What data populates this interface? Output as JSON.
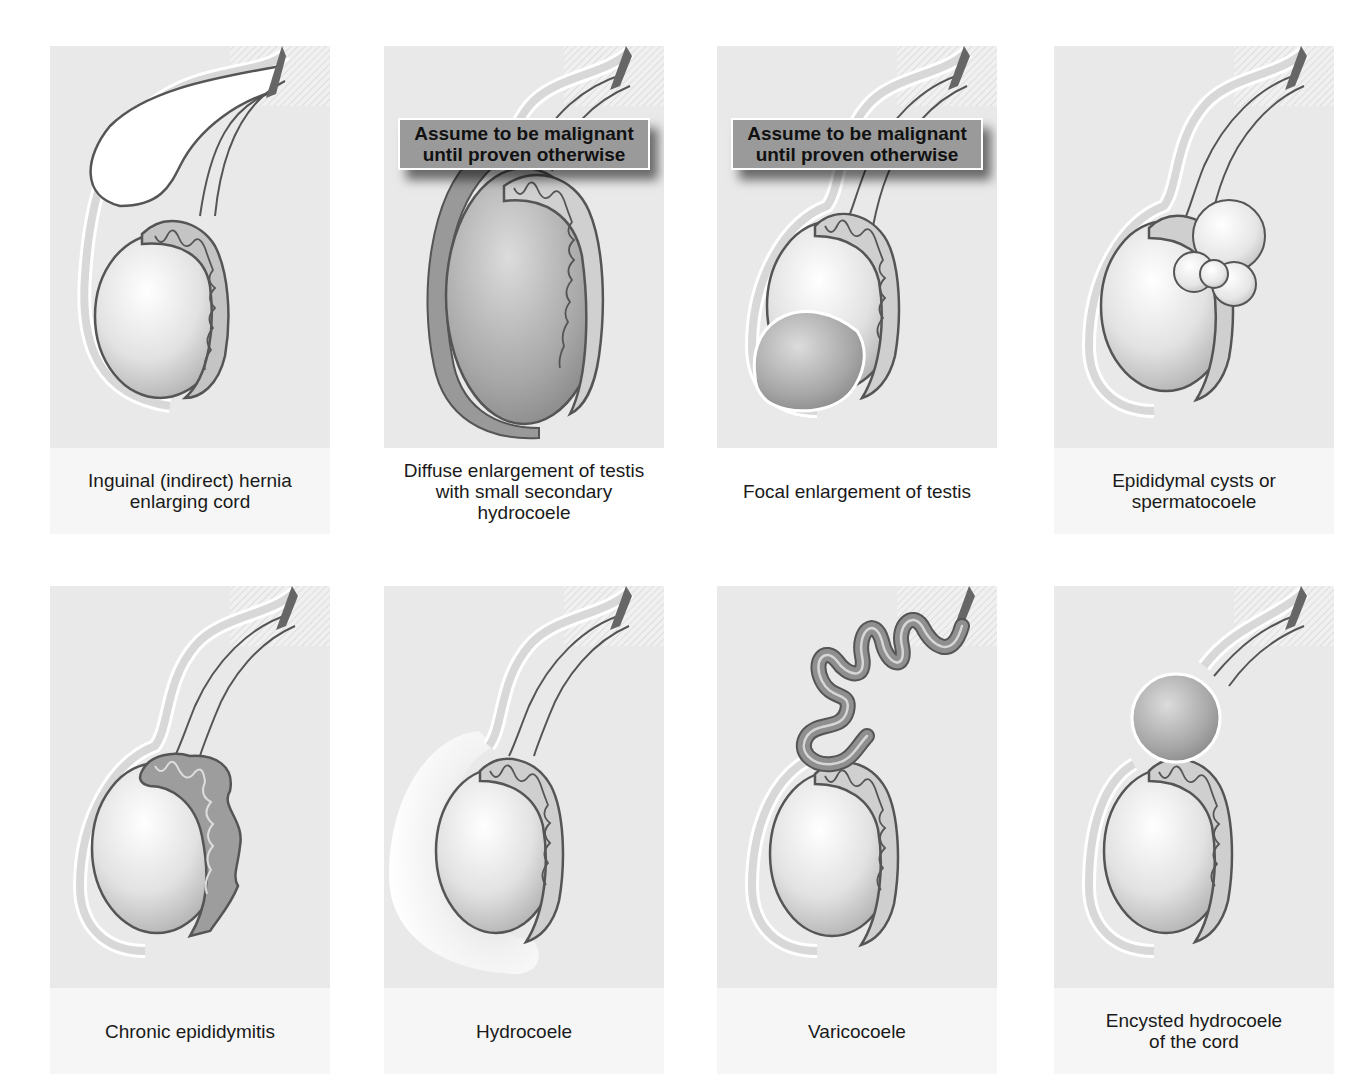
{
  "figure": {
    "panels": [
      {
        "id": "inguinal-hernia",
        "caption": "Inguinal (indirect) hernia\nenlarging cord",
        "warning": null
      },
      {
        "id": "diffuse-enlargement",
        "caption": "Diffuse enlargement of testis\nwith small secondary\nhydrocoele",
        "warning": "Assume to be malignant\nuntil proven otherwise"
      },
      {
        "id": "focal-enlargement",
        "caption": "Focal enlargement of testis",
        "warning": "Assume to be malignant\nuntil proven otherwise"
      },
      {
        "id": "epididymal-cysts",
        "caption": "Epididymal cysts or\nspermatocoele",
        "warning": null
      },
      {
        "id": "chronic-epididymitis",
        "caption": "Chronic epididymitis",
        "warning": null
      },
      {
        "id": "hydrocoele",
        "caption": "Hydrocoele",
        "warning": null
      },
      {
        "id": "varicocoele",
        "caption": "Varicocoele",
        "warning": null
      },
      {
        "id": "encysted-hydrocoele",
        "caption": "Encysted hydrocoele\nof the cord",
        "warning": null
      }
    ]
  },
  "colors": {
    "panel_bg": "#e9e9e9",
    "caption_bg": "#f6f6f6",
    "outline": "#555555",
    "warning_bg": "#9a9a9a",
    "lesion": "#8c8c8c"
  }
}
